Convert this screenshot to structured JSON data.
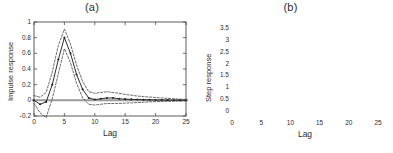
{
  "figure": {
    "background": "#ffffff",
    "line_color": "#222222",
    "band_color": "#3a3a3a",
    "zero_line_color": "#9a9a9a",
    "axis_color": "#4a4a4a"
  },
  "panels": [
    {
      "id": "panel-a",
      "title": "(a)",
      "chart_ref": 0
    },
    {
      "id": "panel-b",
      "title": "(b)",
      "chart_ref": 1
    }
  ],
  "chart_data": [
    {
      "type": "line",
      "title": "(a)",
      "xlabel": "Lag",
      "ylabel": "Impulse response",
      "xlim": [
        0,
        25
      ],
      "ylim": [
        -0.2,
        1.0
      ],
      "xticks": [
        0,
        5,
        10,
        15,
        20,
        25
      ],
      "xticklabels": [
        "0",
        "5",
        "10",
        "15",
        "20",
        "25"
      ],
      "yticks": [
        -0.2,
        0,
        0.2,
        0.4,
        0.6,
        0.8,
        1
      ],
      "yticklabels": [
        "-0.2",
        "0",
        "0.2",
        "0.4",
        "0.6",
        "0.8",
        "1"
      ],
      "grid": false,
      "legend": null,
      "zero_line": 0,
      "x": [
        0,
        1,
        2,
        3,
        4,
        5,
        6,
        7,
        8,
        9,
        10,
        11,
        12,
        13,
        14,
        15,
        16,
        17,
        18,
        19,
        20,
        21,
        22,
        23,
        24,
        25
      ],
      "series": [
        {
          "name": "estimate",
          "style": "solid",
          "marker": "dot",
          "values": [
            0.0,
            -0.05,
            -0.02,
            0.2,
            0.52,
            0.8,
            0.6,
            0.33,
            0.14,
            0.03,
            0.01,
            0.02,
            0.03,
            0.03,
            0.02,
            0.015,
            0.012,
            0.01,
            0.008,
            0.006,
            0.005,
            0.004,
            0.003,
            0.002,
            0.002,
            0.001
          ]
        },
        {
          "name": "upper-confidence-band",
          "style": "dashed",
          "marker": "none",
          "values": [
            0.06,
            0.04,
            0.1,
            0.36,
            0.7,
            0.91,
            0.72,
            0.45,
            0.24,
            0.11,
            0.09,
            0.1,
            0.11,
            0.1,
            0.09,
            0.075,
            0.065,
            0.055,
            0.048,
            0.042,
            0.036,
            0.03,
            0.025,
            0.02,
            0.015,
            0.012
          ]
        },
        {
          "name": "lower-confidence-band",
          "style": "dashed",
          "marker": "none",
          "values": [
            -0.04,
            -0.16,
            -0.22,
            0.02,
            0.34,
            0.66,
            0.48,
            0.22,
            0.03,
            -0.05,
            -0.06,
            -0.05,
            -0.04,
            -0.04,
            -0.04,
            -0.035,
            -0.032,
            -0.028,
            -0.024,
            -0.02,
            -0.017,
            -0.014,
            -0.012,
            -0.01,
            -0.008,
            -0.007
          ]
        }
      ]
    },
    {
      "type": "line",
      "title": "(b)",
      "xlabel": "Lag",
      "ylabel": "Step response",
      "xlim": [
        0,
        25
      ],
      "ylim": [
        -0.25,
        3.75
      ],
      "xticks": [
        0,
        5,
        10,
        15,
        20,
        25
      ],
      "xticklabels": [
        "0",
        "5",
        "10",
        "15",
        "20",
        "25"
      ],
      "yticks": [
        0,
        0.5,
        1,
        1.5,
        2,
        2.5,
        3,
        3.5
      ],
      "yticklabels": [
        "0",
        "0.5",
        "1",
        "1.5",
        "2",
        "2.5",
        "3",
        "3.5"
      ],
      "grid": false,
      "legend": null,
      "zero_line": 0,
      "x": [
        0,
        1,
        2,
        3,
        4,
        5,
        6,
        7,
        8,
        9,
        10,
        11,
        12,
        13,
        14,
        15,
        16,
        17,
        18,
        19,
        20,
        21,
        22,
        23,
        24,
        25
      ],
      "series": [
        {
          "name": "estimate",
          "style": "solid",
          "marker": "dot",
          "values": [
            0.0,
            -0.05,
            -0.07,
            0.13,
            0.65,
            1.45,
            2.05,
            2.38,
            2.52,
            2.55,
            2.56,
            2.58,
            2.61,
            2.64,
            2.66,
            2.68,
            2.69,
            2.7,
            2.71,
            2.72,
            2.73,
            2.73,
            2.74,
            2.75,
            2.75,
            2.76
          ]
        },
        {
          "name": "upper-confidence-band",
          "style": "dashed",
          "marker": "none",
          "values": [
            0.06,
            0.05,
            0.12,
            0.38,
            0.98,
            1.8,
            2.42,
            2.78,
            2.95,
            3.02,
            3.07,
            3.12,
            3.18,
            3.24,
            3.28,
            3.32,
            3.36,
            3.4,
            3.44,
            3.48,
            3.52,
            3.55,
            3.58,
            3.6,
            3.62,
            3.65
          ]
        },
        {
          "name": "lower-confidence-band",
          "style": "dashed",
          "marker": "none",
          "values": [
            -0.04,
            -0.15,
            -0.24,
            -0.08,
            0.36,
            1.1,
            1.68,
            2.0,
            2.15,
            2.2,
            2.23,
            2.26,
            2.3,
            2.33,
            2.36,
            2.38,
            2.4,
            2.41,
            2.42,
            2.43,
            2.44,
            2.45,
            2.46,
            2.46,
            2.47,
            2.47
          ]
        }
      ]
    }
  ]
}
